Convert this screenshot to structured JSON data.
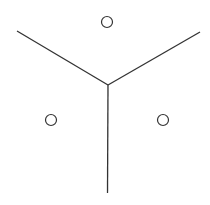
{
  "diagram": {
    "type": "voronoi",
    "colors": {
      "stroke": "#333333",
      "background": "#ffffff"
    },
    "sites": [
      {
        "id": "top"
      },
      {
        "id": "left"
      },
      {
        "id": "right"
      }
    ],
    "edges": [
      {
        "id": "edge-upper-left",
        "between": [
          "top",
          "left"
        ]
      },
      {
        "id": "edge-upper-right",
        "between": [
          "top",
          "right"
        ]
      },
      {
        "id": "edge-bottom",
        "between": [
          "left",
          "right"
        ]
      }
    ]
  }
}
